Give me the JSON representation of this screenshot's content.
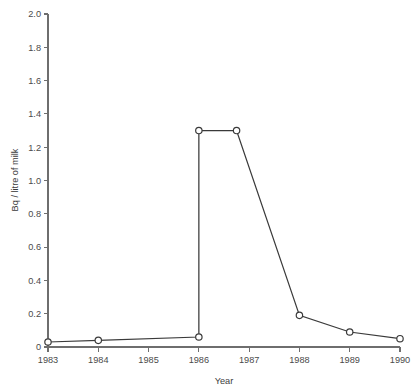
{
  "chart_data": {
    "type": "line",
    "title": "",
    "subtitle": "",
    "xlabel": "Year",
    "ylabel": "Bq / litre of milk",
    "xlim": [
      1983,
      1990
    ],
    "ylim": [
      0,
      2.0
    ],
    "grid": false,
    "legend": null,
    "x_ticks": [
      1983,
      1984,
      1985,
      1986,
      1987,
      1988,
      1989,
      1990
    ],
    "x_tick_labels": [
      "1983",
      "1984",
      "1985",
      "1986",
      "1987",
      "1988",
      "1989",
      "1990"
    ],
    "y_ticks": [
      0,
      0.2,
      0.4,
      0.6,
      0.8,
      1.0,
      1.2,
      1.4,
      1.6,
      1.8,
      2.0
    ],
    "y_tick_labels": [
      "0",
      "0.2",
      "0.4",
      "0.6",
      "0.8",
      "1.0",
      "1.2",
      "1.4",
      "1.6",
      "1.8",
      "2.0"
    ],
    "marker": "open-circle",
    "line_color": "#3a3a3a",
    "marker_fill": "#ffffff",
    "axis_color": "#6e6e6e",
    "series": [
      {
        "name": "Bq / litre of milk",
        "x": [
          1983,
          1984,
          1986,
          1986,
          1986.75,
          1988,
          1989,
          1990
        ],
        "values": [
          0.03,
          0.04,
          0.06,
          1.3,
          1.3,
          0.19,
          0.09,
          0.05
        ],
        "points": [
          {
            "x": 1983,
            "y": 0.03
          },
          {
            "x": 1984,
            "y": 0.04
          },
          {
            "x": 1986,
            "y": 0.06
          },
          {
            "x": 1986,
            "y": 1.3
          },
          {
            "x": 1986.75,
            "y": 1.3
          },
          {
            "x": 1988,
            "y": 0.19
          },
          {
            "x": 1989,
            "y": 0.09
          },
          {
            "x": 1990,
            "y": 0.05
          }
        ]
      }
    ]
  }
}
